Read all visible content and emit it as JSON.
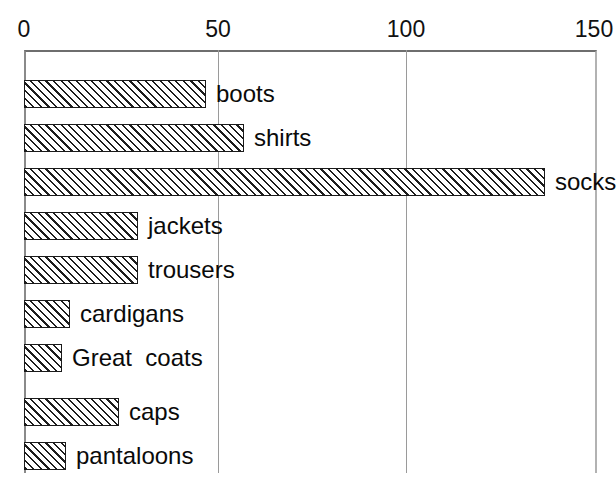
{
  "chart_data": {
    "type": "bar",
    "orientation": "horizontal",
    "title": "",
    "xlabel": "",
    "ylabel": "",
    "xlim": [
      0,
      150
    ],
    "ylim": null,
    "grid": true,
    "axis_position": "top",
    "legend": "none",
    "tick_labels": [
      "0",
      "50",
      "100",
      "150"
    ],
    "ticks": [
      0,
      50,
      100,
      150
    ],
    "categories": [
      "boots",
      "shirts",
      "socks",
      "jackets",
      "trousers",
      "cardigans",
      "Great  coats",
      "caps",
      "pantaloons"
    ],
    "values": [
      48,
      58,
      137,
      30,
      30,
      12,
      10,
      25,
      11
    ],
    "bar_style": {
      "fill": "diagonal-hatch",
      "hatch_color": "#1d1d1d",
      "background": "#ffffff",
      "edge_color": "#1a1a1a"
    },
    "label_position": "right-of-bar"
  },
  "axis": {
    "line_color": "#8a8a8a",
    "grid_color": "#9a9a9a"
  }
}
